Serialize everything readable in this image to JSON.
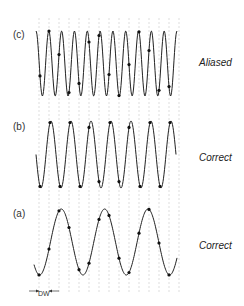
{
  "figure": {
    "grid": {
      "x_start": 39,
      "spacing": 10,
      "count": 15,
      "color": "#c8c8c8"
    },
    "panels": [
      {
        "id": "c",
        "label": "(c)",
        "status": "Aliased",
        "wave": {
          "x0": 36,
          "x1": 177,
          "y_top": 31,
          "y_bot": 96,
          "cycles": 11.0,
          "phase": 0.25
        },
        "samples_x": [
          40,
          49,
          59,
          69,
          79,
          89,
          99,
          109,
          119,
          129,
          139,
          149,
          159,
          169
        ]
      },
      {
        "id": "b",
        "label": "(b)",
        "status": "Correct",
        "wave": {
          "x0": 36,
          "x1": 176,
          "y_top": 121,
          "y_bot": 188,
          "cycles": 7.0,
          "phase": 0.5
        },
        "samples_x": [
          40,
          50,
          60,
          70,
          80,
          89,
          99,
          110,
          119,
          129,
          140,
          150,
          160,
          170
        ]
      },
      {
        "id": "a",
        "label": "(a)",
        "status": "Correct",
        "wave": {
          "x0": 34,
          "x1": 177,
          "y_top": 209,
          "y_bot": 275,
          "cycles": 3.3,
          "phase": 0.62
        },
        "samples_x": [
          39,
          49,
          59,
          69,
          79,
          89,
          99,
          109,
          119,
          129,
          139,
          149,
          159,
          169
        ]
      }
    ],
    "dw_label": "DW"
  }
}
